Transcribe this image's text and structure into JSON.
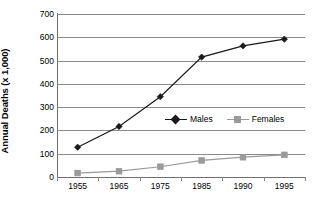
{
  "chart_data": {
    "type": "line",
    "title": "",
    "xlabel": "",
    "ylabel": "Annual Deaths (x 1,000)",
    "categories": [
      "1955",
      "1965",
      "1975",
      "1985",
      "1990",
      "1995"
    ],
    "series": [
      {
        "name": "Males",
        "color": "#1a1a1a",
        "marker": "diamond",
        "values": [
          128,
          217,
          345,
          515,
          563,
          592
        ]
      },
      {
        "name": "Females",
        "color": "#9a9a9a",
        "marker": "square",
        "values": [
          17,
          25,
          44,
          71,
          85,
          95
        ]
      }
    ],
    "ylim": [
      0,
      700
    ],
    "ytick_values": [
      "700",
      "600",
      "500",
      "400",
      "300",
      "200",
      "100",
      "0"
    ],
    "ytick_numbers": [
      700,
      600,
      500,
      400,
      300,
      200,
      100,
      0
    ],
    "grid": true,
    "grid_axis": "y",
    "grid_color": "#8a8a8a",
    "legend_position": "center",
    "legend_entries": [
      "Males",
      "Females"
    ],
    "background_color": "#ffffff",
    "axis_color": "#6e6e6e"
  }
}
